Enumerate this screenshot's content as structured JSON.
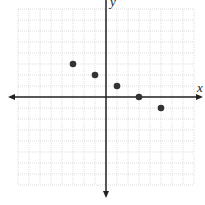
{
  "chart_data": {
    "type": "scatter",
    "title": "",
    "xlabel": "x",
    "ylabel": "y",
    "xlim": [
      -8,
      8
    ],
    "ylim": [
      -8,
      8
    ],
    "grid": true,
    "points": [
      {
        "x": -3,
        "y": 3
      },
      {
        "x": -1,
        "y": 2
      },
      {
        "x": 1,
        "y": 1
      },
      {
        "x": 3,
        "y": 0
      },
      {
        "x": 5,
        "y": -1
      }
    ]
  },
  "axes": {
    "x_label": "x",
    "y_label": "y"
  },
  "style": {
    "grid_color": "#c8c8c8",
    "axis_color": "#222222",
    "point_color": "#333333"
  }
}
